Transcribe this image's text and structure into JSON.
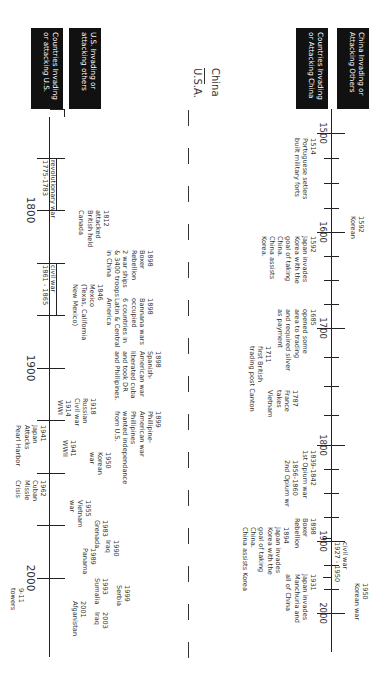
{
  "legend": {
    "china_others": "China Invading or\nAttacking Others",
    "others_china": "Countries Invading\nor Attacking China",
    "us_others": "U.S. Invading or\nattacking others",
    "others_us": "Countries Invading\nor attacking U.S."
  },
  "divider": {
    "china_label": "China",
    "usa_label": "U.S.A."
  },
  "china_axis": {
    "years": [
      "1500",
      "1600",
      "1700",
      "1800",
      "1900",
      "2000"
    ]
  },
  "usa_axis": {
    "years": [
      "1800",
      "1900",
      "2000"
    ]
  },
  "china_attacking_others": [
    {
      "text": "1592\nKorean"
    },
    {
      "text": "1950\nKorean war"
    },
    {
      "text": "civil war\n1927 - 1950"
    }
  ],
  "others_attacking_china": [
    {
      "text": "1514\nPortuguese setlers\nbuilt military forts"
    },
    {
      "text": "1592\nJapan invades\nKorea with the\ngoal of taking\nChina.\nChina assists\nKorea."
    },
    {
      "text": "1685\nopened some\narea to trading\nand required silver\nas payment"
    },
    {
      "text": "1711\nfirst British\ntrading post Canton"
    },
    {
      "text": "1787\nFrance\ntakes\nVietnam"
    },
    {
      "text": "1839-1842\n1st Opium war"
    },
    {
      "text": "1856-1860\n2nd Opium wr"
    },
    {
      "text": "1898\nBoxer\nRebellion"
    },
    {
      "text": "1894\nJapan invades\nKorea with the\ngoal of taking\nChina.\nChina assists Korea"
    },
    {
      "text": "1931\nJapan invades\nManchuria and\nall of China"
    }
  ],
  "us_attacking_others": [
    {
      "text": "1812\nattacked\nBritish held\nCanada"
    },
    {
      "text": "1898\nBoxer\nRebellion\n2 war ships\n& 3400 troops\nin China"
    },
    {
      "text": "1846\nMexico\n(Texas, California\nNew Mexico)"
    },
    {
      "text": "1898\nBannana wars\noccupied\n6 countries in\nLatin & Central\nAmerica"
    },
    {
      "text": "1898\nSpanish-\nAmerican war\nliberated cuba\nand took DR\nand Phillipines."
    },
    {
      "text": "1899\nPhillipine-\nAmerican war\nPhillipines\nwanted independance\nfrom U.S."
    },
    {
      "text": "1914\nWWI"
    },
    {
      "text": "1918\nRussian\nCivil war"
    },
    {
      "text": "1941\nWWII"
    },
    {
      "text": "1950\nKorean\nwar"
    },
    {
      "text": "1955\nVietnam\nwar"
    },
    {
      "text": "1983\nGrenada"
    },
    {
      "text": "1989\nPanama"
    },
    {
      "text": "1990\nIraq"
    },
    {
      "text": "1993\nSumalia"
    },
    {
      "text": "1999\nSerbia"
    },
    {
      "text": "2001\nAfganistan"
    },
    {
      "text": "2003\nIraq"
    }
  ],
  "others_attacking_us": [
    {
      "text": "revolutionary war\n1775-1783"
    },
    {
      "text": "civil war\n1861 - 1865"
    },
    {
      "text": "1941\nJapan\nAttacks\nPearl Harbor"
    },
    {
      "text": "1962\nCuban\nMissle\nCrisis"
    },
    {
      "text": "9-11\ntowers"
    }
  ]
}
